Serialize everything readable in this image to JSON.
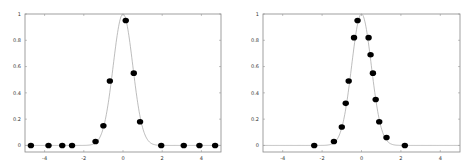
{
  "chart_data": [
    {
      "type": "scatter",
      "title": "",
      "xlabel": "",
      "ylabel": "",
      "xlim": [
        -5,
        5
      ],
      "ylim": [
        -0.05,
        1
      ],
      "grid": false,
      "legend": null,
      "xticks": [
        -4,
        -2,
        0,
        2,
        4
      ],
      "xtick_labels": [
        "-4",
        "-2",
        "0",
        "2",
        "4"
      ],
      "yticks": [
        0,
        0.2,
        0.4,
        0.6,
        0.8,
        1
      ],
      "ytick_labels": [
        "0",
        "0.2",
        "0.4",
        "0.6",
        "0.8",
        "1"
      ],
      "curve": {
        "name": "gaussian fit",
        "type": "line",
        "color": "#9a9a9a",
        "function": "exp(-x^2/(2*0.5^2))"
      },
      "series": [
        {
          "name": "samples",
          "color": "#000000",
          "x": [
            -4.7,
            -3.8,
            -3.1,
            -2.6,
            -1.4,
            -1.0,
            -0.67,
            0.14,
            0.55,
            0.87,
            1.95,
            3.1,
            3.9,
            4.7
          ],
          "y": [
            0,
            0,
            0,
            0,
            0.03,
            0.15,
            0.49,
            0.95,
            0.55,
            0.18,
            0,
            0,
            0,
            0
          ]
        }
      ]
    },
    {
      "type": "scatter",
      "title": "",
      "xlabel": "",
      "ylabel": "",
      "xlim": [
        -5,
        5
      ],
      "ylim": [
        -0.05,
        1
      ],
      "grid": false,
      "legend": null,
      "xticks": [
        -4,
        -2,
        0,
        2,
        4
      ],
      "xtick_labels": [
        "-4",
        "-2",
        "0",
        "2",
        "4"
      ],
      "yticks": [
        0,
        0.2,
        0.4,
        0.6,
        0.8,
        1
      ],
      "ytick_labels": [
        "0",
        "0.2",
        "0.4",
        "0.6",
        "0.8",
        "1"
      ],
      "curve": {
        "name": "gaussian fit",
        "type": "line",
        "color": "#9a9a9a",
        "function": "exp(-x^2/(2*0.5^2))"
      },
      "series": [
        {
          "name": "samples",
          "color": "#000000",
          "x": [
            -2.4,
            -1.4,
            -1.0,
            -0.8,
            -0.65,
            -0.38,
            -0.2,
            0.36,
            0.46,
            0.58,
            0.72,
            0.9,
            1.27,
            2.2
          ],
          "y": [
            0,
            0.03,
            0.14,
            0.32,
            0.49,
            0.82,
            0.95,
            0.82,
            0.69,
            0.55,
            0.35,
            0.18,
            0.06,
            0
          ]
        }
      ]
    }
  ],
  "layout": {
    "panels": [
      {
        "left": 25,
        "top": 14,
        "right": 221,
        "bottom": 152
      },
      {
        "left": 263,
        "top": 14,
        "right": 460,
        "bottom": 152
      }
    ],
    "colors": {
      "frame": "#888888",
      "curve": "#a0a0a0",
      "marker": "#000000",
      "text": "#333333"
    }
  }
}
